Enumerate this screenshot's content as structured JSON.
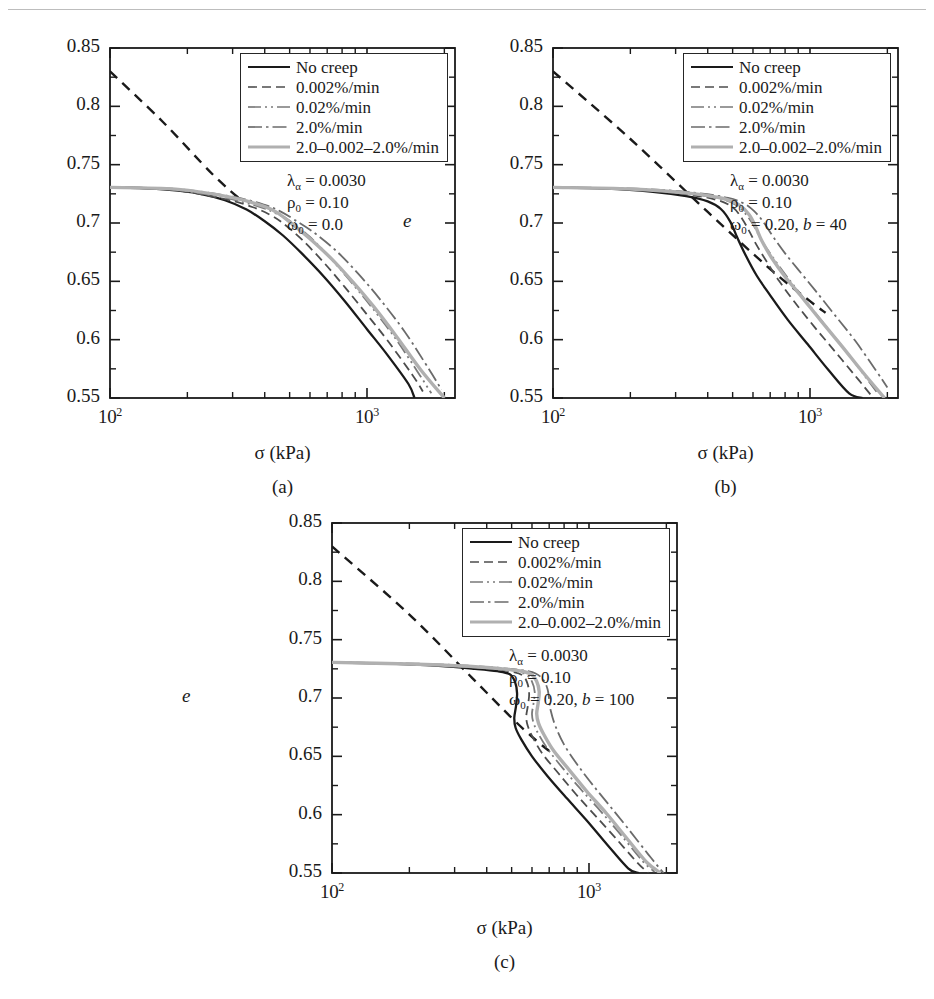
{
  "figure": {
    "panel_captions": [
      "(a)",
      "(b)",
      "(c)"
    ],
    "axis": {
      "xlabel": "σ (kPa)",
      "ylabel": "e",
      "ytick_labels": [
        "0.85",
        "0.8",
        "0.75",
        "0.7",
        "0.65",
        "0.6",
        "0.55"
      ],
      "xtick_labels": [
        "10",
        "10"
      ],
      "xtick_exponents": [
        "2",
        "3"
      ]
    },
    "legend": {
      "entries": [
        {
          "label": "No creep",
          "style": "solid",
          "color": "#1a1a1a",
          "width": 2.2
        },
        {
          "label": "0.002%/min",
          "style": "dashed",
          "color": "#4d4d4d",
          "width": 1.6
        },
        {
          "label": "0.02%/min",
          "style": "dashdotdot",
          "color": "#7a7a7a",
          "width": 1.7
        },
        {
          "label": "2.0%/min",
          "style": "dashdot",
          "color": "#6b6b6b",
          "width": 1.7
        },
        {
          "label": "2.0–0.002–2.0%/min",
          "style": "solid",
          "color": "#b0b0b0",
          "width": 3.2
        }
      ]
    },
    "panels": [
      {
        "id": "a",
        "caption": "(a)",
        "params": {
          "lambda": "λ",
          "lambda_sub": "α",
          "lambda_value": " = 0.0030",
          "rho": "ρ",
          "rho_sub": "0",
          "rho_value": " = 0.10",
          "omega": "ω",
          "omega_sub": "0",
          "omega_value": " = 0.0",
          "b_label": "",
          "b_value": ""
        }
      },
      {
        "id": "b",
        "caption": "(b)",
        "params": {
          "lambda": "λ",
          "lambda_sub": "α",
          "lambda_value": " = 0.0030",
          "rho": "ρ",
          "rho_sub": "0",
          "rho_value": " = 0.10",
          "omega": "ω",
          "omega_sub": "0",
          "omega_value": " = 0.20, ",
          "b_label": "b",
          "b_value": " = 40"
        }
      },
      {
        "id": "c",
        "caption": "(c)",
        "params": {
          "lambda": "λ",
          "lambda_sub": "α",
          "lambda_value": " = 0.0030",
          "rho": "ρ",
          "rho_sub": "0",
          "rho_value": " = 0.10",
          "omega": "ω",
          "omega_sub": "0",
          "omega_value": " = 0.20, ",
          "b_label": "b",
          "b_value": " = 100"
        }
      }
    ]
  },
  "chart_data": {
    "type": "line",
    "title": "",
    "xlabel": "σ (kPa)",
    "ylabel": "e",
    "xscale": "log",
    "xlim": [
      100,
      2200
    ],
    "ylim": [
      0.55,
      0.85
    ],
    "ytick_values": [
      0.85,
      0.8,
      0.75,
      0.7,
      0.65,
      0.6,
      0.55
    ],
    "xtick_values": [
      100,
      1000
    ],
    "grid": false,
    "legend_position": "top-right",
    "panels": [
      {
        "id": "a",
        "caption": "(a)",
        "annotations": [
          "λα = 0.0030",
          "ρ0 = 0.10",
          "ω0 = 0.0"
        ],
        "series": [
          {
            "name": "reference-line",
            "style": "dashed",
            "color": "#1a1a1a",
            "x": [
              100,
              160,
              250,
              330
            ],
            "y": [
              0.83,
              0.787,
              0.742,
              0.718
            ]
          },
          {
            "name": "No creep",
            "style": "solid",
            "color": "#1a1a1a",
            "x": [
              100,
              130,
              170,
              220,
              280,
              340,
              400,
              470,
              560,
              680,
              820,
              1000,
              1200,
              1450,
              1530
            ],
            "y": [
              0.7305,
              0.73,
              0.7285,
              0.7255,
              0.7195,
              0.7115,
              0.7015,
              0.6895,
              0.6735,
              0.654,
              0.633,
              0.609,
              0.587,
              0.562,
              0.55
            ]
          },
          {
            "name": "0.002%/min",
            "style": "dashed",
            "color": "#4d4d4d",
            "x": [
              100,
              170,
              280,
              360,
              420,
              470,
              560,
              680,
              820,
              1000,
              1200,
              1500,
              1650
            ],
            "y": [
              0.7305,
              0.7288,
              0.7205,
              0.7135,
              0.707,
              0.7,
              0.6855,
              0.666,
              0.645,
              0.6215,
              0.5995,
              0.57,
              0.5555
            ]
          },
          {
            "name": "0.02%/min",
            "style": "dashdotdot",
            "color": "#7a7a7a",
            "x": [
              100,
              170,
              280,
              380,
              440,
              500,
              600,
              720,
              870,
              1050,
              1300,
              1600,
              1780
            ],
            "y": [
              0.7305,
              0.729,
              0.7215,
              0.714,
              0.7085,
              0.702,
              0.688,
              0.67,
              0.649,
              0.627,
              0.6,
              0.57,
              0.554
            ]
          },
          {
            "name": "2.0%/min",
            "style": "dashdot",
            "color": "#6b6b6b",
            "x": [
              100,
              180,
              300,
              400,
              460,
              520,
              620,
              760,
              920,
              1120,
              1400,
              1750,
              1950
            ],
            "y": [
              0.7305,
              0.7292,
              0.7225,
              0.7155,
              0.71,
              0.703,
              0.692,
              0.676,
              0.657,
              0.635,
              0.607,
              0.574,
              0.557
            ]
          },
          {
            "name": "2.0-0.002-2.0%/min",
            "style": "solid",
            "color": "#b0b0b0",
            "x": [
              100,
              180,
              300,
              400,
              450,
              500,
              600,
              730,
              880,
              1060,
              1300,
              1620,
              2000
            ],
            "y": [
              0.7305,
              0.729,
              0.7218,
              0.714,
              0.7085,
              0.701,
              0.6865,
              0.669,
              0.6495,
              0.6285,
              0.603,
              0.574,
              0.55
            ]
          }
        ]
      },
      {
        "id": "b",
        "caption": "(b)",
        "annotations": [
          "λα = 0.0030",
          "ρ0 = 0.10",
          "ω0 = 0.20, b = 40"
        ],
        "series": [
          {
            "name": "reference-line",
            "style": "dashed",
            "color": "#1a1a1a",
            "x": [
              100,
              200,
              400,
              700,
              1000,
              1150
            ],
            "y": [
              0.83,
              0.772,
              0.7095,
              0.6605,
              0.633,
              0.623
            ]
          },
          {
            "name": "No creep",
            "style": "solid",
            "color": "#1a1a1a",
            "x": [
              100,
              160,
              240,
              330,
              400,
              450,
              490,
              520,
              560,
              620,
              700,
              820,
              980,
              1180,
              1420,
              1600
            ],
            "y": [
              0.7305,
              0.7295,
              0.727,
              0.723,
              0.7185,
              0.712,
              0.701,
              0.688,
              0.673,
              0.655,
              0.638,
              0.617,
              0.596,
              0.574,
              0.554,
              0.55
            ]
          },
          {
            "name": "0.002%/min",
            "style": "dashed",
            "color": "#4d4d4d",
            "x": [
              100,
              200,
              330,
              430,
              500,
              545,
              580,
              620,
              680,
              760,
              880,
              1040,
              1250,
              1500,
              1720
            ],
            "y": [
              0.7305,
              0.729,
              0.7245,
              0.72,
              0.7135,
              0.7035,
              0.693,
              0.681,
              0.6665,
              0.65,
              0.631,
              0.611,
              0.59,
              0.569,
              0.553
            ]
          },
          {
            "name": "0.02%/min",
            "style": "dashdotdot",
            "color": "#7a7a7a",
            "x": [
              100,
              200,
              340,
              450,
              520,
              570,
              610,
              650,
              720,
              820,
              950,
              1120,
              1350,
              1620,
              1820
            ],
            "y": [
              0.7305,
              0.7292,
              0.725,
              0.7205,
              0.715,
              0.706,
              0.696,
              0.6845,
              0.67,
              0.653,
              0.635,
              0.615,
              0.593,
              0.57,
              0.555
            ]
          },
          {
            "name": "2.0%/min",
            "style": "dashdot",
            "color": "#6b6b6b",
            "x": [
              100,
              210,
              360,
              480,
              560,
              620,
              670,
              720,
              800,
              900,
              1050,
              1250,
              1500,
              1800,
              2000
            ],
            "y": [
              0.7305,
              0.7295,
              0.7258,
              0.7215,
              0.716,
              0.708,
              0.6985,
              0.688,
              0.674,
              0.66,
              0.642,
              0.621,
              0.599,
              0.574,
              0.559
            ]
          },
          {
            "name": "2.0-0.002-2.0%/min",
            "style": "solid",
            "color": "#b0b0b0",
            "x": [
              100,
              200,
              350,
              460,
              530,
              580,
              615,
              650,
              710,
              800,
              930,
              1100,
              1330,
              1620,
              1950
            ],
            "y": [
              0.7305,
              0.7292,
              0.7252,
              0.721,
              0.7155,
              0.707,
              0.6965,
              0.6845,
              0.67,
              0.654,
              0.6365,
              0.6165,
              0.5945,
              0.571,
              0.55
            ]
          }
        ]
      },
      {
        "id": "c",
        "caption": "(c)",
        "annotations": [
          "λα = 0.0030",
          "ρ0 = 0.10",
          "ω0 = 0.20, b = 100"
        ],
        "series": [
          {
            "name": "reference-line",
            "style": "dashed",
            "color": "#1a1a1a",
            "x": [
              100,
              200,
              350,
              500,
              620,
              700
            ],
            "y": [
              0.83,
              0.7715,
              0.7175,
              0.683,
              0.664,
              0.6545
            ]
          },
          {
            "name": "No creep",
            "style": "solid",
            "color": "#1a1a1a",
            "x": [
              100,
              170,
              260,
              360,
              440,
              490,
              515,
              525,
              520,
              512,
              518,
              545,
              600,
              690,
              820,
              980,
              1180,
              1420,
              1560
            ],
            "y": [
              0.7305,
              0.7295,
              0.7275,
              0.725,
              0.723,
              0.7205,
              0.714,
              0.704,
              0.693,
              0.683,
              0.6745,
              0.6645,
              0.65,
              0.633,
              0.614,
              0.595,
              0.574,
              0.554,
              0.55
            ]
          },
          {
            "name": "0.002%/min",
            "style": "dashed",
            "color": "#4d4d4d",
            "x": [
              100,
              200,
              320,
              430,
              500,
              550,
              575,
              585,
              578,
              570,
              578,
              605,
              660,
              760,
              890,
              1060,
              1280,
              1540,
              1700
            ],
            "y": [
              0.7305,
              0.729,
              0.7268,
              0.7245,
              0.7225,
              0.7195,
              0.713,
              0.7035,
              0.693,
              0.684,
              0.676,
              0.666,
              0.652,
              0.6355,
              0.6175,
              0.599,
              0.579,
              0.559,
              0.55
            ]
          },
          {
            "name": "0.02%/min",
            "style": "dashdotdot",
            "color": "#7a7a7a",
            "x": [
              100,
              200,
              330,
              450,
              520,
              570,
              600,
              615,
              608,
              600,
              610,
              640,
              700,
              800,
              940,
              1120,
              1350,
              1620,
              1800
            ],
            "y": [
              0.7305,
              0.7292,
              0.727,
              0.7248,
              0.723,
              0.72,
              0.714,
              0.705,
              0.695,
              0.686,
              0.678,
              0.668,
              0.6545,
              0.6385,
              0.6205,
              0.602,
              0.581,
              0.56,
              0.551
            ]
          },
          {
            "name": "2.0%/min",
            "style": "dashdot",
            "color": "#6b6b6b",
            "x": [
              100,
              210,
              350,
              480,
              560,
              620,
              665,
              690,
              700,
              710,
              740,
              800,
              900,
              1030,
              1200,
              1420,
              1700,
              1950
            ],
            "y": [
              0.7305,
              0.7295,
              0.7275,
              0.7252,
              0.7235,
              0.721,
              0.7155,
              0.7075,
              0.6985,
              0.689,
              0.676,
              0.66,
              0.643,
              0.626,
              0.608,
              0.588,
              0.566,
              0.55
            ]
          },
          {
            "name": "2.0-0.002-2.0%/min",
            "style": "solid",
            "color": "#b0b0b0",
            "x": [
              100,
              200,
              340,
              460,
              540,
              595,
              625,
              640,
              634,
              626,
              636,
              668,
              730,
              840,
              980,
              1170,
              1400,
              1680,
              1900
            ],
            "y": [
              0.7305,
              0.7292,
              0.7272,
              0.725,
              0.7232,
              0.7205,
              0.7145,
              0.7055,
              0.6955,
              0.6865,
              0.6785,
              0.6685,
              0.6545,
              0.638,
              0.62,
              0.601,
              0.58,
              0.559,
              0.55
            ]
          }
        ]
      }
    ]
  }
}
